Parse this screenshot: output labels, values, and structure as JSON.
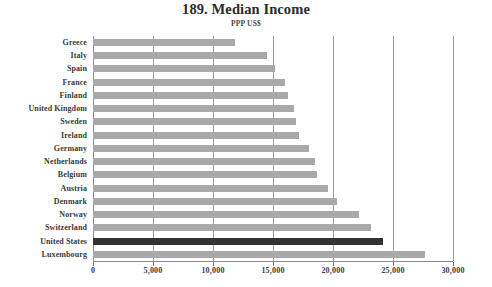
{
  "chart_data": {
    "type": "bar",
    "orientation": "horizontal",
    "title": "189. Median Income",
    "subtitle": "PPP US$",
    "xlabel": "",
    "ylabel": "",
    "xlim": [
      0,
      30000
    ],
    "xticks": [
      0,
      5000,
      10000,
      15000,
      20000,
      25000,
      30000
    ],
    "xtick_labels": [
      "0",
      "5,000",
      "10,000",
      "15,000",
      "20,000",
      "25,000",
      "30,000"
    ],
    "grid": true,
    "legend": "none",
    "categories": [
      "Greece",
      "Italy",
      "Spain",
      "France",
      "Finland",
      "United Kingdom",
      "Sweden",
      "Ireland",
      "Germany",
      "Netherlands",
      "Belgium",
      "Austria",
      "Denmark",
      "Norway",
      "Switzerland",
      "United States",
      "Luxembourg"
    ],
    "values": [
      11800,
      14500,
      15200,
      16000,
      16250,
      16750,
      16900,
      17150,
      18000,
      18500,
      18700,
      19600,
      20300,
      22150,
      23150,
      24200,
      27650
    ],
    "highlight_category": "United States",
    "colors": {
      "bar": "#a9a9a9",
      "bar_highlight": "#333333",
      "gridline": "#9a9a9a",
      "axis": "#8a8a8a",
      "text": "#3a3a3a",
      "background": "#ffffff"
    }
  }
}
